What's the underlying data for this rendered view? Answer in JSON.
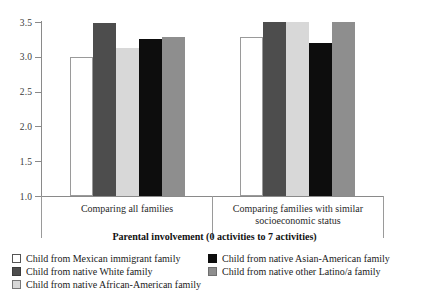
{
  "chart_data": {
    "type": "bar",
    "title": "",
    "xlabel": "Parental involvement (0 activities to 7 activities)",
    "ylabel": "",
    "ylim": [
      1.0,
      3.5
    ],
    "yticks": [
      "1.0",
      "1.5",
      "2.0",
      "2.5",
      "3.0",
      "3.5"
    ],
    "grid": false,
    "legend_position": "bottom",
    "categories": [
      "Comparing all families",
      "Comparing families with similar socioeconomic status"
    ],
    "series": [
      {
        "name": "Child from Mexican immigrant family",
        "swatch": "sw-white",
        "color": "#ffffff",
        "values": [
          3.0,
          3.29
        ]
      },
      {
        "name": "Child from native White family",
        "swatch": "sw-dark",
        "color": "#4d4d4d",
        "values": [
          3.48,
          3.5
        ]
      },
      {
        "name": "Child from native African-American family",
        "swatch": "sw-light",
        "color": "#d8d8d8",
        "values": [
          3.13,
          3.5
        ]
      },
      {
        "name": "Child from native Asian-American family",
        "swatch": "sw-black",
        "color": "#0d0d0d",
        "values": [
          3.25,
          3.2
        ]
      },
      {
        "name": "Child from native other Latino/a family",
        "swatch": "sw-medium",
        "color": "#8e8e8e",
        "values": [
          3.29,
          3.5
        ]
      }
    ],
    "annotations": [
      {
        "type": "hline",
        "value": 1.9,
        "color": "#ffffff"
      }
    ]
  },
  "legend": {
    "column_left": [
      "Child from Mexican immigrant family",
      "Child from native White family",
      "Child from native African-American family"
    ],
    "column_right": [
      "Child from native Asian-American family",
      "Child from native other Latino/a family"
    ]
  }
}
